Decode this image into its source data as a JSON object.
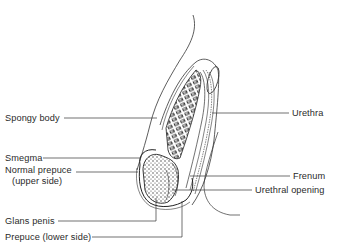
{
  "figure": {
    "type": "anatomical-diagram",
    "colors": {
      "ink": "#2a2a2a",
      "background": "#ffffff"
    }
  },
  "labels": {
    "left": [
      {
        "id": "spongy-body",
        "text": "Spongy body"
      },
      {
        "id": "smegma",
        "text": "Smegma"
      },
      {
        "id": "normal-prepuce-line1",
        "text": "Normal prepuce"
      },
      {
        "id": "normal-prepuce-line2",
        "text": "(upper side)"
      },
      {
        "id": "glans-penis",
        "text": "Glans penis"
      },
      {
        "id": "prepuce-lower",
        "text": "Prepuce (lower side)"
      }
    ],
    "right": [
      {
        "id": "urethra",
        "text": "Urethra"
      },
      {
        "id": "frenum",
        "text": "Frenum"
      },
      {
        "id": "urethral-opening",
        "text": "Urethral opening"
      }
    ]
  }
}
